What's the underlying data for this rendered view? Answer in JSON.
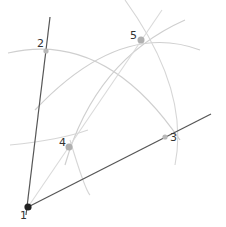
{
  "diagram": {
    "colors": {
      "ray": "#555555",
      "arc": "#cfcfcf",
      "bisector": "#d9d9d9",
      "point": "#b0b0b0",
      "vertex": "#222222",
      "label": "#333333"
    },
    "points": [
      {
        "id": "1",
        "label": "1",
        "x": 28,
        "y": 207
      },
      {
        "id": "2",
        "label": "2",
        "x": 46,
        "y": 51
      },
      {
        "id": "3",
        "label": "3",
        "x": 165,
        "y": 137
      },
      {
        "id": "4",
        "label": "4",
        "x": 69,
        "y": 147
      },
      {
        "id": "5",
        "label": "5",
        "x": 141,
        "y": 40
      }
    ],
    "labels": [
      {
        "text": "1",
        "x": 20,
        "y": 210
      },
      {
        "text": "2",
        "x": 37,
        "y": 38
      },
      {
        "text": "3",
        "x": 170,
        "y": 132
      },
      {
        "text": "4",
        "x": 59,
        "y": 137
      },
      {
        "text": "5",
        "x": 130,
        "y": 30
      }
    ]
  }
}
